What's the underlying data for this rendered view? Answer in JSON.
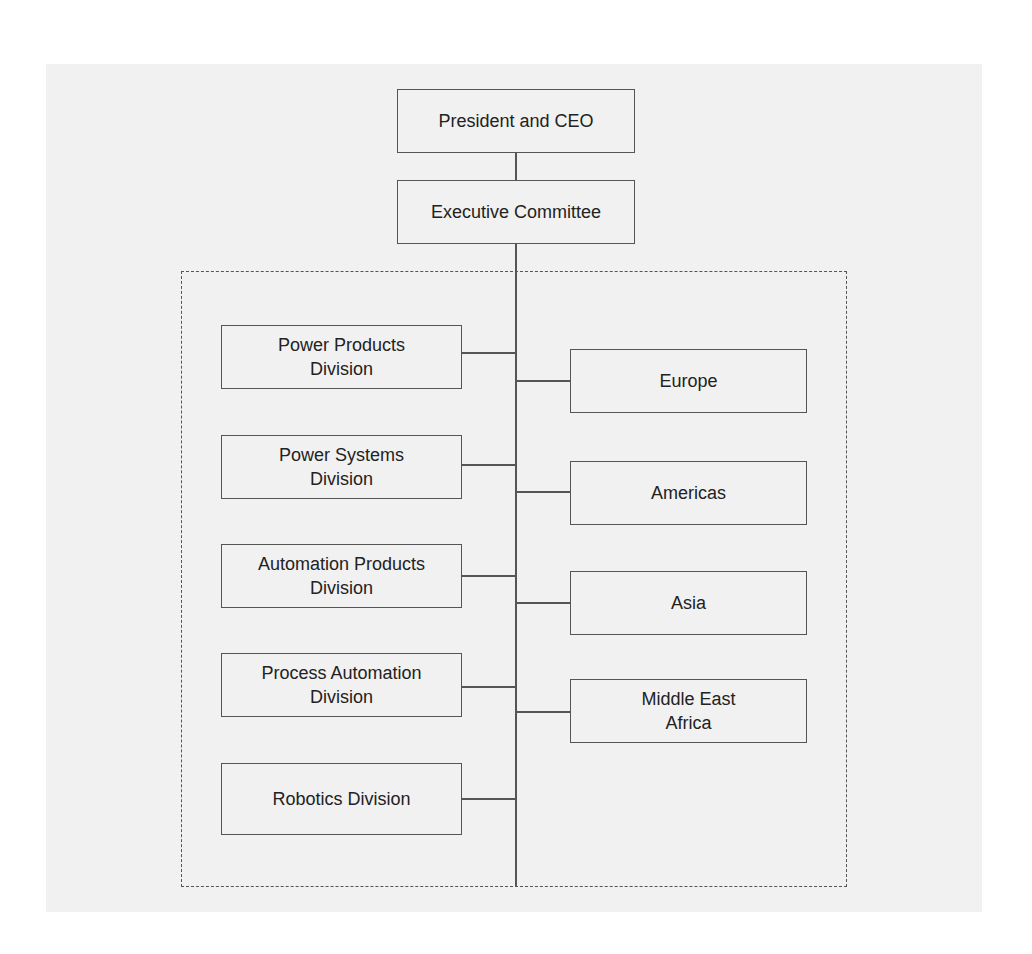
{
  "chart": {
    "top": [
      {
        "id": "president",
        "label": "President and CEO"
      },
      {
        "id": "executive",
        "label": "Executive Committee"
      }
    ],
    "divisions": [
      {
        "label": "Power Products\nDivision"
      },
      {
        "label": "Power Systems\nDivision"
      },
      {
        "label": "Automation Products\nDivision"
      },
      {
        "label": "Process Automation\nDivision"
      },
      {
        "label": "Robotics Division"
      }
    ],
    "regions": [
      {
        "label": "Europe"
      },
      {
        "label": "Americas"
      },
      {
        "label": "Asia"
      },
      {
        "label": "Middle East\nAfrica"
      }
    ]
  },
  "colors": {
    "background": "#f1f1f1",
    "line": "#555555",
    "text": "#222222"
  }
}
